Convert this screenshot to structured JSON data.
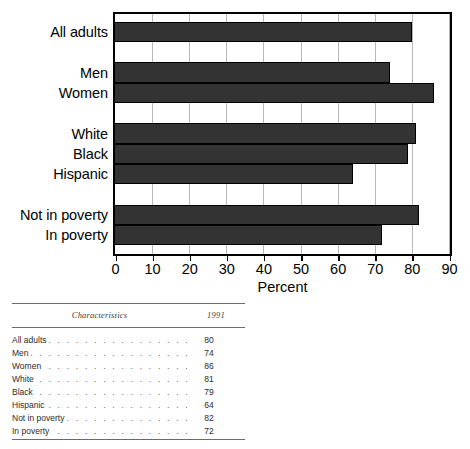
{
  "chart_data": {
    "type": "bar",
    "orientation": "horizontal",
    "title": "",
    "xlabel": "Percent",
    "ylabel": "",
    "xlim": [
      0,
      90
    ],
    "ylim": null,
    "grid": true,
    "legend": false,
    "bar_color": "#333333",
    "gridline_color": "#b8b8b8",
    "xticks": [
      0,
      10,
      20,
      30,
      40,
      50,
      60,
      70,
      80,
      90
    ],
    "xticklabels": [
      "0",
      "10",
      "20",
      "30",
      "40",
      "50",
      "60",
      "70",
      "80",
      "90"
    ],
    "categories": [
      "All adults",
      "Men",
      "Women",
      "White",
      "Black",
      "Hispanic",
      "Not in poverty",
      "In poverty"
    ],
    "values": [
      80,
      74,
      86,
      81,
      79,
      64,
      82,
      72
    ],
    "groups": [
      {
        "name": "total",
        "categories": [
          "All adults"
        ]
      },
      {
        "name": "sex",
        "categories": [
          "Men",
          "Women"
        ]
      },
      {
        "name": "race-ethnicity",
        "categories": [
          "White",
          "Black",
          "Hispanic"
        ]
      },
      {
        "name": "poverty-status",
        "categories": [
          "Not in poverty",
          "In poverty"
        ]
      }
    ]
  },
  "table": {
    "headers": {
      "characteristics": "Characteristics",
      "year": "1991"
    },
    "leader": ". . . . . . . . . . . . . . . . . . . . . . . . . . . . . . . . . . . . . . . . .",
    "rows": [
      {
        "label": "All adults",
        "value": "80"
      },
      {
        "label": "Men",
        "value": "74"
      },
      {
        "label": "Women",
        "value": "86"
      },
      {
        "label": "White",
        "value": "81"
      },
      {
        "label": "Black",
        "value": "79"
      },
      {
        "label": "Hispanic",
        "value": "64"
      },
      {
        "label": "Not in poverty",
        "value": "82"
      },
      {
        "label": "In poverty",
        "value": "72"
      }
    ]
  }
}
